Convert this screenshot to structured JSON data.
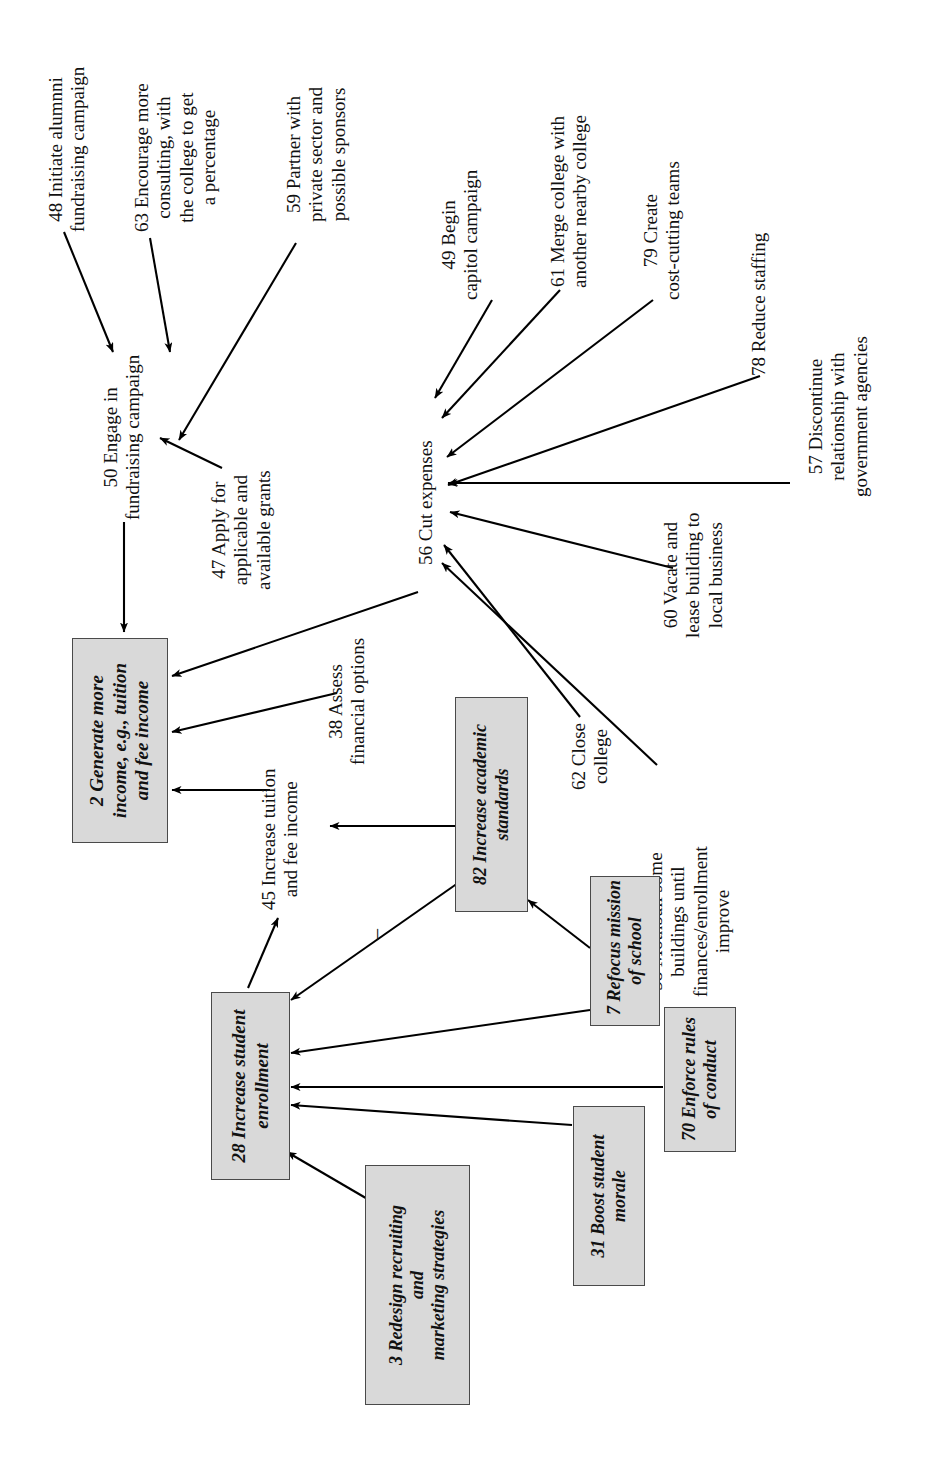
{
  "diagram": {
    "orientation": "rotated-90-ccw",
    "box_fill": "#d9d9d9",
    "box_stroke": "#4a4a4a",
    "edge_color": "#000000",
    "background": "#ffffff",
    "annotations": [
      {
        "name": "negative-link-sign",
        "label": "–"
      }
    ]
  },
  "nodes": [
    {
      "id": "48",
      "name": "node-48-initiate-alumni-fundraising-campaign",
      "style": "plain",
      "lines": [
        "48 Initiate alumnni",
        "fundraising campaign"
      ]
    },
    {
      "id": "63",
      "name": "node-63-encourage-more-consulting",
      "style": "plain",
      "lines": [
        "63 Encourage more",
        "consulting, with",
        "the college to get",
        "a percentage"
      ]
    },
    {
      "id": "59",
      "name": "node-59-partner-with-private-sector",
      "style": "plain",
      "lines": [
        "59 Partner with",
        "private sector and",
        "possible sponsors"
      ]
    },
    {
      "id": "49",
      "name": "node-49-begin-capitol-campaign",
      "style": "plain",
      "lines": [
        "49 Begin",
        "capitol campaign"
      ]
    },
    {
      "id": "61",
      "name": "node-61-merge-college-with-another-nearby-college",
      "style": "plain",
      "lines": [
        "61 Merge college with",
        "another nearby college"
      ]
    },
    {
      "id": "79",
      "name": "node-79-create-cost-cutting-teams",
      "style": "plain",
      "lines": [
        "79 Create",
        "cost-cutting teams"
      ]
    },
    {
      "id": "78",
      "name": "node-78-reduce-staffing",
      "style": "plain",
      "lines": [
        "78 Reduce staffing"
      ]
    },
    {
      "id": "57",
      "name": "node-57-discontinue-relationship-with-government-agencies",
      "style": "plain",
      "lines": [
        "57 Discontinue",
        "relationship with",
        "government agencies"
      ]
    },
    {
      "id": "50",
      "name": "node-50-engage-in-fundraising-campaign",
      "style": "plain",
      "lines": [
        "50 Engage in",
        "fundraising campaign"
      ]
    },
    {
      "id": "47",
      "name": "node-47-apply-for-applicable-and-available-grants",
      "style": "plain",
      "lines": [
        "47 Apply for",
        "applicable and",
        "available grants"
      ]
    },
    {
      "id": "56",
      "name": "node-56-cut-expenses",
      "style": "plain",
      "lines": [
        "56 Cut expenses"
      ]
    },
    {
      "id": "60",
      "name": "node-60-vacate-and-lease-building-to-local-business",
      "style": "plain",
      "lines": [
        "60 Vacate and",
        "lease building to",
        "local business"
      ]
    },
    {
      "id": "58",
      "name": "node-58-mothball-some-buildings",
      "style": "plain",
      "lines": [
        "58 Mothball some",
        "buildings until",
        "finances/enrollment",
        "improve"
      ]
    },
    {
      "id": "62",
      "name": "node-62-close-college",
      "style": "plain",
      "lines": [
        "62 Close",
        "college"
      ]
    },
    {
      "id": "38",
      "name": "node-38-assess-financial-options",
      "style": "plain",
      "lines": [
        "38 Assess",
        "financial options"
      ]
    },
    {
      "id": "45",
      "name": "node-45-increase-tuition-and-fee-income",
      "style": "plain",
      "lines": [
        "45 Increase tuition",
        "and fee income"
      ]
    },
    {
      "id": "2",
      "name": "node-2-generate-more-income",
      "style": "boxed",
      "lines": [
        "2 Generate more",
        "income, e.g., tuition",
        "and fee income"
      ]
    },
    {
      "id": "82",
      "name": "node-82-increase-academic-standards",
      "style": "boxed",
      "lines": [
        "82 Increase academic",
        "standards"
      ]
    },
    {
      "id": "7",
      "name": "node-7-refocus-mission-of-school",
      "style": "boxed",
      "lines": [
        "7 Refocus mission",
        "of school"
      ]
    },
    {
      "id": "28",
      "name": "node-28-increase-student-enrollment",
      "style": "boxed",
      "lines": [
        "28 Increase student",
        "enrollment"
      ]
    },
    {
      "id": "70",
      "name": "node-70-enforce-rules-of-conduct",
      "style": "boxed",
      "lines": [
        "70 Enforce rules",
        "of conduct"
      ]
    },
    {
      "id": "31",
      "name": "node-31-boost-student-morale",
      "style": "boxed",
      "lines": [
        "31 Boost student",
        "morale"
      ]
    },
    {
      "id": "3",
      "name": "node-3-redesign-recruiting-and-marketing-strategies",
      "style": "boxed",
      "lines": [
        "3 Redesign recruiting",
        "and",
        "marketing strategies"
      ]
    }
  ],
  "edges": [
    {
      "name": "edge-48-to-50",
      "from": "48",
      "to": "50"
    },
    {
      "name": "edge-63-to-50",
      "from": "63",
      "to": "50"
    },
    {
      "name": "edge-59-to-50",
      "from": "59",
      "to": "50"
    },
    {
      "name": "edge-47-to-50",
      "from": "47",
      "to": "50"
    },
    {
      "name": "edge-50-to-2",
      "from": "50",
      "to": "2"
    },
    {
      "name": "edge-49-to-56",
      "from": "49",
      "to": "56"
    },
    {
      "name": "edge-61-to-56",
      "from": "61",
      "to": "56"
    },
    {
      "name": "edge-79-to-56",
      "from": "79",
      "to": "56"
    },
    {
      "name": "edge-78-to-56",
      "from": "78",
      "to": "56"
    },
    {
      "name": "edge-57-to-56",
      "from": "57",
      "to": "56"
    },
    {
      "name": "edge-60-to-56",
      "from": "60",
      "to": "56"
    },
    {
      "name": "edge-62-to-56",
      "from": "62",
      "to": "56"
    },
    {
      "name": "edge-58-to-56",
      "from": "58",
      "to": "56"
    },
    {
      "name": "edge-56-to-2",
      "from": "56",
      "to": "2"
    },
    {
      "name": "edge-38-to-2",
      "from": "38",
      "to": "2"
    },
    {
      "name": "edge-45-to-2",
      "from": "45",
      "to": "2"
    },
    {
      "name": "edge-28-to-45",
      "from": "28",
      "to": "45"
    },
    {
      "name": "edge-82-to-45",
      "from": "82",
      "to": "45"
    },
    {
      "name": "edge-82-to-28-negative",
      "from": "82",
      "to": "28",
      "sign": "–"
    },
    {
      "name": "edge-7-to-82",
      "from": "7",
      "to": "82"
    },
    {
      "name": "edge-7-to-28",
      "from": "7",
      "to": "28"
    },
    {
      "name": "edge-70-to-28",
      "from": "70",
      "to": "28"
    },
    {
      "name": "edge-31-to-28",
      "from": "31",
      "to": "28"
    },
    {
      "name": "edge-3-to-28",
      "from": "3",
      "to": "28"
    }
  ]
}
